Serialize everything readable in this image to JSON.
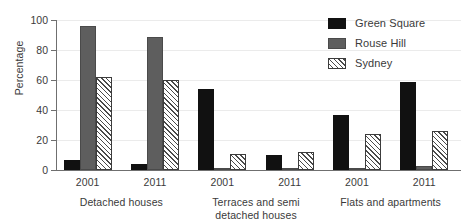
{
  "chart_data": {
    "type": "bar",
    "title": "",
    "xlabel": "",
    "ylabel": "Percentage",
    "ylim": [
      0,
      100
    ],
    "yticks": [
      0,
      20,
      40,
      60,
      80,
      100
    ],
    "grid": true,
    "legend_position": "top-right",
    "categories": [
      "2001",
      "2011",
      "2001",
      "2011",
      "2001",
      "2011"
    ],
    "groups": [
      {
        "label": "Detached houses",
        "label_lines": [
          "Detached houses"
        ],
        "subcategories": [
          "2001",
          "2011"
        ]
      },
      {
        "label": "Terraces and semi detached houses",
        "label_lines": [
          "Terraces and semi",
          "detached houses"
        ],
        "subcategories": [
          "2001",
          "2011"
        ]
      },
      {
        "label": "Flats and apartments",
        "label_lines": [
          "Flats and apartments"
        ],
        "subcategories": [
          "2001",
          "2011"
        ]
      }
    ],
    "series": [
      {
        "name": "Green Square",
        "color": "#111111",
        "pattern": "solid",
        "values": [
          7,
          4,
          54,
          10,
          37,
          59
        ]
      },
      {
        "name": "Rouse Hill",
        "color": "#5e5e5e",
        "pattern": "solid",
        "values": [
          96,
          89,
          1,
          1,
          1,
          3
        ]
      },
      {
        "name": "Sydney",
        "color": "#ffffff",
        "pattern": "diagonal-hatch",
        "values": [
          62,
          60,
          11,
          12,
          24,
          26
        ]
      }
    ]
  },
  "legend": {
    "items": [
      {
        "label": "Green Square",
        "swatch": "green-square"
      },
      {
        "label": "Rouse Hill",
        "swatch": "rouse-hill"
      },
      {
        "label": "Sydney",
        "swatch": "sydney"
      }
    ]
  }
}
